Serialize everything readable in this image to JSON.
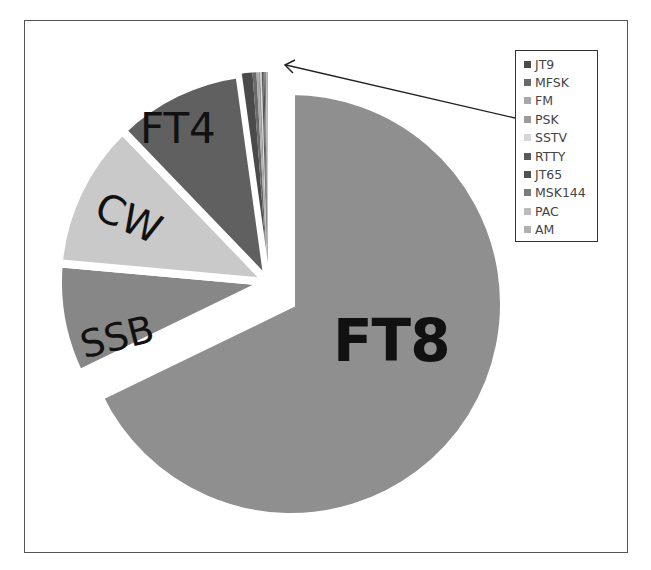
{
  "chart_data": {
    "type": "pie",
    "title": "",
    "exploded": "FT8",
    "legend_position": "right-top",
    "slices": [
      {
        "label": "FT8",
        "value": 67.8,
        "color": "#8f8f8f",
        "show_label": true
      },
      {
        "label": "SSB",
        "value": 8.6,
        "color": "#878787",
        "show_label": true
      },
      {
        "label": "CW",
        "value": 11.4,
        "color": "#c9c9c9",
        "show_label": true
      },
      {
        "label": "FT4",
        "value": 10.0,
        "color": "#606060",
        "show_label": true
      },
      {
        "label": "JT9",
        "value": 1.0,
        "color": "#4a4a4a",
        "show_label": false
      },
      {
        "label": "MFSK",
        "value": 0.3,
        "color": "#6a6a6a",
        "show_label": false
      },
      {
        "label": "FM",
        "value": 0.15,
        "color": "#a8a8a8",
        "show_label": false
      },
      {
        "label": "PSK",
        "value": 0.15,
        "color": "#9a9a9a",
        "show_label": false
      },
      {
        "label": "SSTV",
        "value": 0.1,
        "color": "#d6d6d6",
        "show_label": false
      },
      {
        "label": "RTTY",
        "value": 0.12,
        "color": "#5a5a5a",
        "show_label": false
      },
      {
        "label": "JT65",
        "value": 0.1,
        "color": "#505050",
        "show_label": false
      },
      {
        "label": "MSK144",
        "value": 0.1,
        "color": "#7c7c7c",
        "show_label": false
      },
      {
        "label": "PAC",
        "value": 0.08,
        "color": "#bcbcbc",
        "show_label": false
      },
      {
        "label": "AM",
        "value": 0.08,
        "color": "#b0b0b0",
        "show_label": false
      }
    ],
    "legend": [
      "JT9",
      "MFSK",
      "FM",
      "PSK",
      "SSTV",
      "RTTY",
      "JT65",
      "MSK144",
      "PAC",
      "AM"
    ],
    "annotation": "arrow from legend to the small slices at top of pie"
  },
  "labels": {
    "ft8": "FT8",
    "ssb": "SSB",
    "cw": "CW",
    "ft4": "FT4"
  },
  "legend": {
    "items": [
      {
        "label": "JT9",
        "color": "#4a4a4a"
      },
      {
        "label": "MFSK",
        "color": "#6a6a6a"
      },
      {
        "label": "FM",
        "color": "#a8a8a8"
      },
      {
        "label": "PSK",
        "color": "#9a9a9a"
      },
      {
        "label": "SSTV",
        "color": "#d6d6d6"
      },
      {
        "label": "RTTY",
        "color": "#5a5a5a"
      },
      {
        "label": "JT65",
        "color": "#505050"
      },
      {
        "label": "MSK144",
        "color": "#7c7c7c"
      },
      {
        "label": "PAC",
        "color": "#bcbcbc"
      },
      {
        "label": "AM",
        "color": "#b0b0b0"
      }
    ]
  }
}
